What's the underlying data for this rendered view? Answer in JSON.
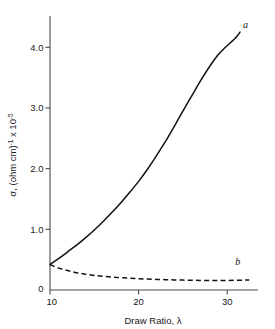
{
  "chart_data": {
    "type": "line",
    "title": "",
    "xlabel": "Draw Ratio, λ",
    "ylabel_main": "σ, (ohm cm)",
    "ylabel_sup1": "-1",
    "ylabel_mid": " x 10",
    "ylabel_sup2": "-5",
    "ylabel_full": "σ, (ohm cm)-1 x 10-5",
    "xlim": [
      10,
      32.8
    ],
    "ylim": [
      0,
      4.45
    ],
    "xticks": [
      10,
      20,
      30
    ],
    "xtick_labels": [
      "10",
      "20",
      "30"
    ],
    "yticks": [
      0,
      1.0,
      2.0,
      3.0,
      4.0
    ],
    "ytick_labels": [
      "0",
      "1.0",
      "2.0",
      "3.0",
      "4.0"
    ],
    "grid": false,
    "legend": "inline-curve-labels",
    "series": [
      {
        "name": "a",
        "label": "a",
        "style": "solid",
        "color": "#111111",
        "label_x": 31.5,
        "label_y": 4.32,
        "x": [
          10,
          11,
          12,
          13,
          14,
          15,
          16,
          17,
          18,
          19,
          20,
          21,
          22,
          23,
          24,
          25,
          26,
          27,
          28,
          29,
          29.8,
          30.4,
          30.9,
          31.2,
          31.45
        ],
        "y": [
          0.42,
          0.52,
          0.63,
          0.74,
          0.86,
          0.99,
          1.13,
          1.28,
          1.44,
          1.61,
          1.79,
          1.99,
          2.21,
          2.44,
          2.69,
          2.95,
          3.2,
          3.45,
          3.68,
          3.88,
          4.0,
          4.08,
          4.15,
          4.2,
          4.25
        ]
      },
      {
        "name": "b",
        "label": "b",
        "style": "dashed",
        "color": "#111111",
        "label_x": 30.9,
        "label_y": 0.42,
        "x": [
          10,
          11,
          12,
          13,
          14,
          15,
          16,
          17,
          18,
          19,
          20,
          21,
          22,
          23,
          24,
          25,
          26,
          27,
          28,
          29,
          30,
          31,
          32,
          32.5
        ],
        "y": [
          0.42,
          0.36,
          0.32,
          0.285,
          0.26,
          0.24,
          0.225,
          0.212,
          0.202,
          0.194,
          0.186,
          0.18,
          0.175,
          0.17,
          0.166,
          0.163,
          0.16,
          0.158,
          0.157,
          0.157,
          0.158,
          0.16,
          0.163,
          0.165
        ]
      }
    ]
  },
  "colors": {
    "background": "#ffffff",
    "axis": "#4a4a4a",
    "curve": "#111111",
    "text": "#1a1a1a"
  }
}
